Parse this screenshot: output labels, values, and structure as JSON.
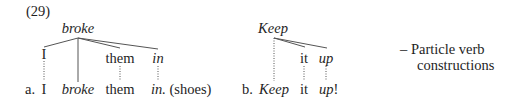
{
  "example_number": "(29)",
  "example_a": {
    "head": "broke",
    "tree_nodes": [
      "I",
      "them",
      "in"
    ],
    "sentence": {
      "label": "a.",
      "words": [
        "I",
        "broke",
        "them",
        "in."
      ],
      "trailing": "(shoes)"
    }
  },
  "example_b": {
    "head": "Keep",
    "tree_nodes": [
      "it",
      "up"
    ],
    "sentence": {
      "label": "b.",
      "words": [
        "Keep",
        "it",
        "up"
      ],
      "trailing": "!"
    }
  },
  "annotation": {
    "dash": "–",
    "line1": "Particle verb",
    "line2": "constructions"
  },
  "colors": {
    "text": "#1e1e1e",
    "lines": "#555555",
    "background": "#ffffff"
  }
}
